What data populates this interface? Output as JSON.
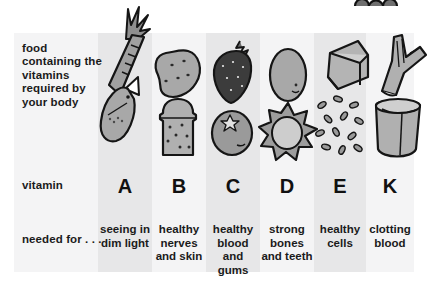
{
  "figure": {
    "type": "illustrated-table",
    "caption_present": false,
    "background_color": "#ececed",
    "stripe_light_color": "#f4f4f5",
    "stripe_dark_color": "#e7e7e8"
  },
  "row_labels": {
    "foods": "food containing the vitamins required by your body",
    "vitamin": "vitamin",
    "needed_for": "needed for . . ."
  },
  "columns": [
    {
      "vitamin": "A",
      "needed_for": "seeing in dim light",
      "foods": [
        "carrot",
        "fish"
      ],
      "icons": [
        "carrot-icon",
        "fish-icon"
      ]
    },
    {
      "vitamin": "B",
      "needed_for": "healthy nerves and skin",
      "foods": [
        "potato",
        "bread"
      ],
      "icons": [
        "potato-icon",
        "bread-slice-icon"
      ]
    },
    {
      "vitamin": "C",
      "needed_for": "healthy blood and gums",
      "foods": [
        "strawberry",
        "orange"
      ],
      "icons": [
        "strawberry-icon",
        "orange-icon"
      ]
    },
    {
      "vitamin": "D",
      "needed_for": "strong bones and teeth",
      "foods": [
        "egg",
        "sunshine"
      ],
      "icons": [
        "egg-icon",
        "sun-icon"
      ]
    },
    {
      "vitamin": "E",
      "needed_for": "healthy cells",
      "foods": [
        "butter",
        "seeds"
      ],
      "icons": [
        "butter-block-icon",
        "seeds-icon"
      ]
    },
    {
      "vitamin": "K",
      "needed_for": "clotting blood",
      "foods": [
        "leek",
        "bowl of yoghurt"
      ],
      "icons": [
        "leek-icon",
        "bowl-icon"
      ]
    }
  ],
  "decoration": {
    "berries": "berry-cluster-icon"
  }
}
